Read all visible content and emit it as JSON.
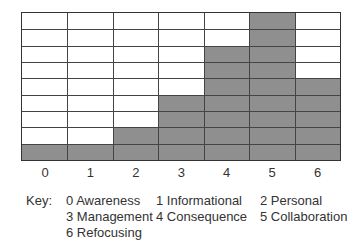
{
  "chart_data": {
    "type": "bar",
    "title": "",
    "xlabel": "",
    "ylabel": "",
    "categories": [
      "0",
      "1",
      "2",
      "3",
      "4",
      "5",
      "6"
    ],
    "values": [
      1,
      1,
      2,
      4,
      7,
      9,
      5
    ],
    "ylim": [
      0,
      9
    ],
    "grid": true,
    "bar_color": "#8f8f8f",
    "legend_position": "bottom",
    "key_label": "Key:",
    "key": [
      {
        "code": "0",
        "label": "Awareness"
      },
      {
        "code": "1",
        "label": "Informational"
      },
      {
        "code": "2",
        "label": "Personal"
      },
      {
        "code": "3",
        "label": "Management"
      },
      {
        "code": "4",
        "label": "Consequence"
      },
      {
        "code": "5",
        "label": "Collaboration"
      },
      {
        "code": "6",
        "label": "Refocusing"
      }
    ]
  }
}
